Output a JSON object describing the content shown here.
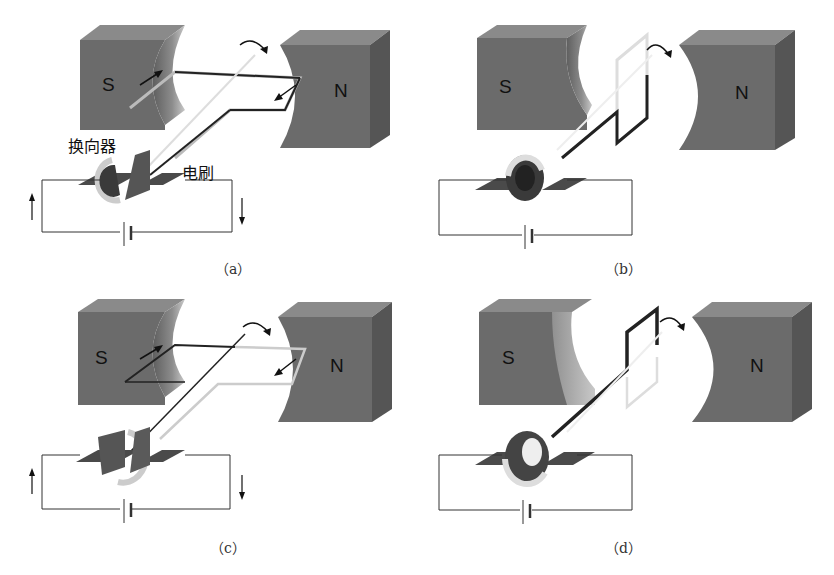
{
  "figure": {
    "panels": [
      {
        "id": "a",
        "caption": "（a）",
        "south_label": "S",
        "north_label": "N",
        "commutator_label": "换向器",
        "brush_label": "电刷"
      },
      {
        "id": "b",
        "caption": "（b）",
        "south_label": "S",
        "north_label": "N"
      },
      {
        "id": "c",
        "caption": "（c）",
        "south_label": "S",
        "north_label": "N"
      },
      {
        "id": "d",
        "caption": "（d）",
        "south_label": "S",
        "north_label": "N"
      }
    ],
    "colors": {
      "magnet_front": "#6b6b6b",
      "magnet_top": "#8a8a8a",
      "magnet_side": "#555555",
      "wire": "#333333",
      "coil_light": "#cfcfcf",
      "coil_dark": "#2a2a2a"
    }
  }
}
